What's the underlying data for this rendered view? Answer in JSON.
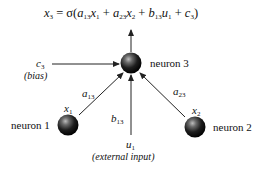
{
  "equation": {
    "lhs": "x",
    "lhs_sub": "3",
    "text": "x₃ = σ(a₁₃x₁ + a₂₃x₂ + b₁₃u₁ + c₃)",
    "parts": [
      {
        "v": "x",
        "s": "3"
      },
      {
        "op": " = σ("
      },
      {
        "v": "a",
        "s": "13"
      },
      {
        "v": "x",
        "s": "1"
      },
      {
        "op": " + "
      },
      {
        "v": "a",
        "s": "23"
      },
      {
        "v": "x",
        "s": "2"
      },
      {
        "op": " + "
      },
      {
        "v": "b",
        "s": "13"
      },
      {
        "v": "u",
        "s": "1"
      },
      {
        "op": " + "
      },
      {
        "v": "c",
        "s": "3"
      },
      {
        "op": ")"
      }
    ]
  },
  "nodes": {
    "neuron1": {
      "label": "neuron 1",
      "var": "x",
      "var_sub": "1"
    },
    "neuron2": {
      "label": "neuron 2",
      "var": "x",
      "var_sub": "2"
    },
    "neuron3": {
      "label": "neuron 3"
    }
  },
  "edges": {
    "bias": {
      "var": "c",
      "sub": "3",
      "desc": "(bias)"
    },
    "w13": {
      "var": "a",
      "sub": "13"
    },
    "w23": {
      "var": "a",
      "sub": "23"
    },
    "input": {
      "var": "b",
      "sub": "13"
    },
    "external": {
      "var": "u",
      "sub": "1",
      "desc": "(external input)"
    }
  },
  "colors": {
    "node": "#1a1a1a",
    "line": "#222222",
    "background": "#ffffff"
  }
}
